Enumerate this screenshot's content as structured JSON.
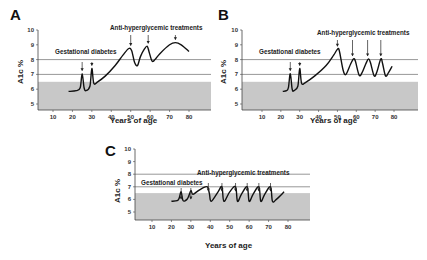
{
  "chart_data": [
    {
      "panel": "A",
      "type": "line",
      "xlabel": "Years of age",
      "ylabel": "A1c %",
      "xticks": [
        10,
        20,
        30,
        40,
        50,
        60,
        70,
        80
      ],
      "yticks": [
        5,
        6,
        7,
        8,
        9,
        10
      ],
      "ylim": [
        4.6,
        10
      ],
      "xlim": [
        2,
        90
      ],
      "reference_lines": [
        7,
        8
      ],
      "shaded_band": {
        "from": 4.6,
        "to": 6.5,
        "color": "#c8c8c8"
      },
      "annotations": [
        {
          "text": "Gestational diabetes",
          "arrows_at": [
            25,
            30
          ]
        },
        {
          "text": "Anti-hyperglycemic treatments",
          "arrows_at": [
            50,
            59,
            73
          ]
        }
      ],
      "series": [
        {
          "name": "A1c trajectory",
          "x": [
            18,
            22,
            24,
            25,
            26,
            27,
            29,
            30,
            31,
            33,
            37,
            42,
            46,
            49,
            50.5,
            52,
            53.5,
            55,
            57,
            58.5,
            59.5,
            61,
            62.5,
            65,
            70,
            73,
            76,
            80
          ],
          "y": [
            5.85,
            5.9,
            6.1,
            7.05,
            6.1,
            5.9,
            6.2,
            7.4,
            6.4,
            6.5,
            6.9,
            7.6,
            8.3,
            8.75,
            8.6,
            7.8,
            7.6,
            8.2,
            8.7,
            8.9,
            8.5,
            7.9,
            8.0,
            8.4,
            9.0,
            9.15,
            9.0,
            8.55
          ]
        }
      ]
    },
    {
      "panel": "B",
      "type": "line",
      "xlabel": "Years of age",
      "ylabel": "A1c %",
      "xticks": [
        10,
        20,
        30,
        40,
        50,
        60,
        70,
        80
      ],
      "yticks": [
        5,
        6,
        7,
        8,
        9,
        10
      ],
      "ylim": [
        4.6,
        10
      ],
      "xlim": [
        2,
        90
      ],
      "reference_lines": [
        7,
        8
      ],
      "shaded_band": {
        "from": 4.6,
        "to": 6.5,
        "color": "#c8c8c8"
      },
      "annotations": [
        {
          "text": "Gestational diabetes",
          "arrows_at": [
            25,
            30
          ]
        },
        {
          "text": "Anti-hyperglycemic treatments",
          "arrows_at": [
            50,
            58,
            66,
            73
          ]
        }
      ],
      "series": [
        {
          "name": "A1c trajectory",
          "x": [
            21,
            23,
            24,
            25,
            26,
            27,
            29,
            30,
            31,
            33,
            38,
            44,
            48,
            50,
            51,
            53,
            54.5,
            57,
            58.5,
            59.5,
            61.5,
            63,
            65,
            66.5,
            67.5,
            69.5,
            71,
            73,
            74,
            75.5,
            77,
            79
          ],
          "y": [
            5.85,
            5.9,
            6.1,
            7.05,
            6.0,
            5.9,
            6.2,
            7.4,
            6.4,
            6.45,
            6.9,
            7.6,
            8.3,
            8.7,
            8.6,
            7.3,
            7.0,
            7.7,
            8.05,
            7.9,
            6.95,
            7.1,
            7.7,
            8.05,
            7.8,
            6.9,
            7.2,
            8.05,
            7.7,
            6.9,
            7.1,
            7.55
          ]
        }
      ]
    },
    {
      "panel": "C",
      "type": "line",
      "xlabel": "Years of age",
      "ylabel": "A1c %",
      "xticks": [
        10,
        20,
        30,
        40,
        50,
        60,
        70,
        80
      ],
      "yticks": [
        5,
        6,
        7,
        8,
        9,
        10
      ],
      "ylim": [
        4.6,
        10
      ],
      "xlim": [
        2,
        90
      ],
      "reference_lines": [
        7,
        8
      ],
      "shaded_band": {
        "from": 4.6,
        "to": 6.5,
        "color": "#c8c8c8"
      },
      "annotations": [
        {
          "text": "Gestational diabetes",
          "arrows_at": [
            25,
            30
          ]
        },
        {
          "text": "Anti-hyperglycemic treatments",
          "arrows_at": [
            39,
            46,
            53,
            59,
            65,
            71
          ]
        }
      ],
      "series": [
        {
          "name": "A1c trajectory",
          "x": [
            20,
            23,
            24,
            25,
            26,
            28,
            29,
            30,
            31,
            33,
            36,
            38.5,
            39.5,
            40.5,
            44,
            46,
            47,
            50,
            53,
            54,
            56,
            59,
            60,
            62,
            65,
            66,
            68,
            71,
            72,
            74,
            78
          ],
          "y": [
            5.85,
            5.9,
            6.1,
            6.6,
            5.9,
            6.0,
            6.3,
            6.7,
            6.4,
            6.6,
            6.9,
            7.0,
            6.5,
            5.85,
            6.6,
            7.0,
            5.85,
            6.6,
            7.0,
            5.85,
            6.4,
            7.0,
            5.85,
            6.4,
            7.0,
            5.85,
            6.4,
            7.0,
            5.85,
            6.0,
            6.6
          ]
        }
      ]
    }
  ],
  "panels": [
    {
      "label": "A",
      "xlabel": "Years of age",
      "ylabel": "A1c %",
      "anno_gest": "Gestational diabetes",
      "anno_treat": "Anti-hyperglycemic treatments"
    },
    {
      "label": "B",
      "xlabel": "Years of age",
      "ylabel": "A1c %",
      "anno_gest": "Gestational diabetes",
      "anno_treat": "Anti-hyperglycemic treatments"
    },
    {
      "label": "C",
      "xlabel": "Years of age",
      "ylabel": "A1c %",
      "anno_gest": "Gestational diabetes",
      "anno_treat": "Anti-hyperglycemic treatments"
    }
  ],
  "colors": {
    "band": "#c8c8c8",
    "ref_line": "#6a6a6a",
    "curve": "#111111",
    "axis": "#444444"
  }
}
